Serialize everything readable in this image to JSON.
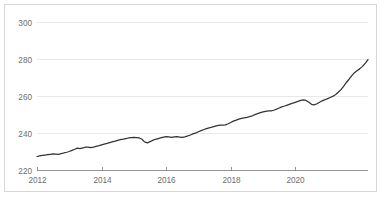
{
  "chart_data": {
    "type": "line",
    "title": "",
    "subtitle": "",
    "xlabel": "",
    "ylabel": "",
    "xlim": [
      2012.0,
      2022.25
    ],
    "ylim": [
      220,
      305
    ],
    "grid": true,
    "legend": false,
    "legend_position": "none",
    "line_color": "#333333",
    "grid_color": "#e9e9e9",
    "axis_color": "#8a8a8a",
    "tick_label_color": "#6e6e6e",
    "border_color": "#d8d8d8",
    "background": "#ffffff",
    "yticks": [
      220,
      240,
      260,
      280,
      300
    ],
    "ytick_labels": [
      "220",
      "240",
      "260",
      "280",
      "300"
    ],
    "xticks": [
      2012,
      2014,
      2016,
      2018,
      2020
    ],
    "xtick_labels": [
      "2012",
      "2014",
      "2016",
      "2018",
      "2020"
    ],
    "series": [
      {
        "name": "index",
        "x": [
          2012.0,
          2012.08,
          2012.17,
          2012.25,
          2012.33,
          2012.42,
          2012.5,
          2012.58,
          2012.67,
          2012.75,
          2012.83,
          2012.92,
          2013.0,
          2013.08,
          2013.17,
          2013.25,
          2013.33,
          2013.42,
          2013.5,
          2013.58,
          2013.67,
          2013.75,
          2013.83,
          2013.92,
          2014.0,
          2014.08,
          2014.17,
          2014.25,
          2014.33,
          2014.42,
          2014.5,
          2014.58,
          2014.67,
          2014.75,
          2014.83,
          2014.92,
          2015.0,
          2015.08,
          2015.17,
          2015.25,
          2015.33,
          2015.42,
          2015.5,
          2015.58,
          2015.67,
          2015.75,
          2015.83,
          2015.92,
          2016.0,
          2016.08,
          2016.17,
          2016.25,
          2016.33,
          2016.42,
          2016.5,
          2016.58,
          2016.67,
          2016.75,
          2016.83,
          2016.92,
          2017.0,
          2017.08,
          2017.17,
          2017.25,
          2017.33,
          2017.42,
          2017.5,
          2017.58,
          2017.67,
          2017.75,
          2017.83,
          2017.92,
          2018.0,
          2018.08,
          2018.17,
          2018.25,
          2018.33,
          2018.42,
          2018.5,
          2018.58,
          2018.67,
          2018.75,
          2018.83,
          2018.92,
          2019.0,
          2019.08,
          2019.17,
          2019.25,
          2019.33,
          2019.42,
          2019.5,
          2019.58,
          2019.67,
          2019.75,
          2019.83,
          2019.92,
          2020.0,
          2020.08,
          2020.17,
          2020.25,
          2020.33,
          2020.42,
          2020.5,
          2020.58,
          2020.67,
          2020.75,
          2020.83,
          2020.92,
          2021.0,
          2021.08,
          2021.17,
          2021.25,
          2021.33,
          2021.42,
          2021.5,
          2021.58,
          2021.67,
          2021.75,
          2021.83,
          2021.92,
          2022.0,
          2022.08,
          2022.17,
          2022.25
        ],
        "values": [
          227.3,
          227.6,
          227.9,
          228.1,
          228.3,
          228.5,
          228.7,
          228.6,
          228.5,
          228.8,
          229.2,
          229.6,
          230.0,
          230.6,
          231.2,
          231.8,
          231.6,
          231.9,
          232.4,
          232.3,
          232.1,
          232.4,
          232.8,
          233.2,
          233.6,
          234.0,
          234.4,
          234.8,
          235.2,
          235.6,
          236.0,
          236.4,
          236.7,
          237.0,
          237.3,
          237.5,
          237.6,
          237.5,
          237.3,
          236.6,
          235.2,
          234.7,
          235.3,
          236.0,
          236.6,
          237.0,
          237.4,
          237.8,
          238.1,
          237.9,
          237.6,
          237.9,
          238.0,
          237.8,
          237.6,
          237.9,
          238.4,
          238.9,
          239.5,
          240.1,
          240.7,
          241.3,
          241.9,
          242.4,
          242.8,
          243.2,
          243.6,
          244.0,
          244.3,
          244.2,
          244.4,
          245.0,
          245.7,
          246.4,
          247.0,
          247.5,
          247.9,
          248.2,
          248.4,
          248.8,
          249.3,
          249.9,
          250.5,
          251.0,
          251.4,
          251.7,
          251.9,
          252.0,
          252.3,
          252.9,
          253.5,
          254.1,
          254.6,
          255.1,
          255.6,
          256.1,
          256.6,
          257.1,
          257.6,
          257.9,
          257.6,
          256.6,
          255.5,
          255.2,
          255.8,
          256.6,
          257.4,
          258.0,
          258.6,
          259.2,
          259.9,
          260.8,
          262.0,
          263.6,
          265.4,
          267.3,
          269.2,
          271.0,
          272.6,
          273.8,
          274.8,
          276.0,
          277.8,
          279.7
        ]
      }
    ]
  }
}
